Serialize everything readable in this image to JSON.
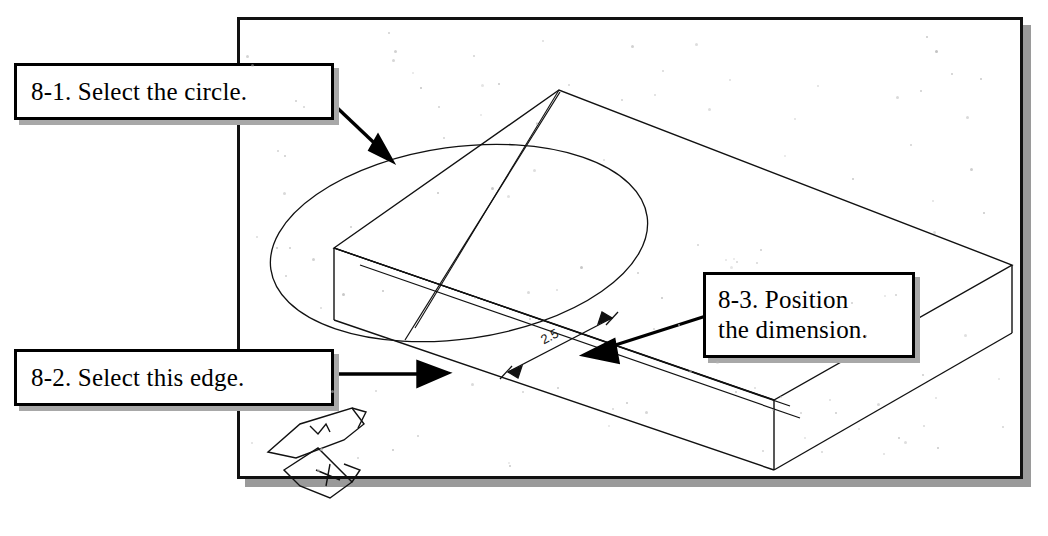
{
  "figure": {
    "kind": "cad-isometric-tutorial-figure",
    "background_color": "#ffffff",
    "ink_color": "#000000",
    "frame": {
      "name": "drawing-frame",
      "border_color": "#111111",
      "shadow_color": "#9a9a9a"
    }
  },
  "callouts": [
    {
      "id": "8-1",
      "name": "callout-select-circle",
      "lines": [
        "8-1. Select the circle."
      ],
      "arrow_target": "circle-ellipse-edge"
    },
    {
      "id": "8-2",
      "name": "callout-select-edge",
      "lines": [
        "8-2. Select this edge."
      ],
      "arrow_target": "box-front-bottom-edge"
    },
    {
      "id": "8-3",
      "name": "callout-position-dimension",
      "lines": [
        "8-3. Position",
        "the dimension."
      ],
      "arrow_target": "dimension-line"
    }
  ],
  "dimension": {
    "name": "aligned-dimension",
    "value": "2.5",
    "arrowheads": 2
  },
  "ucs_icon": {
    "name": "ucs-icon",
    "axis_labels": [
      "Y",
      "X"
    ]
  },
  "geometry": {
    "solid": "rectangular-box-isometric",
    "feature": "circle-on-top-face",
    "description": "Isometric wireframe box with a circle drawn on its top face"
  }
}
